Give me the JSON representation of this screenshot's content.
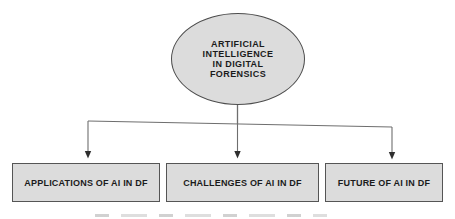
{
  "root_node": {
    "label": "ARTIFICIAL INTELLIGENCE IN DIGITAL FORENSICS",
    "lines": [
      "ARTIFICIAL",
      "INTELLIGENCE",
      "IN DIGITAL",
      "FORENSICS"
    ]
  },
  "child_nodes": [
    {
      "label": "APPLICATIONS OF AI IN DF"
    },
    {
      "label": "CHALLENGES OF AI IN DF"
    },
    {
      "label": "FUTURE OF AI IN DF"
    }
  ],
  "colors": {
    "background": "#ffffff",
    "node_fill": "#dcdcdc",
    "node_border": "#4d4d4d",
    "connector_line": "#6e6e6e",
    "arrowhead": "#2e2e2e",
    "text": "#1b1b1b"
  }
}
